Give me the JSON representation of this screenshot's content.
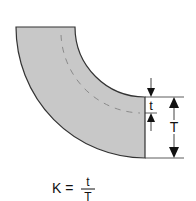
{
  "diagram": {
    "colors": {
      "fill": "#c8c8c8",
      "stroke": "#333333",
      "neutral_axis": "#8a8a8a",
      "arrows": "#111111"
    },
    "labels": {
      "neutral_offset": "t",
      "thickness": "T"
    },
    "formula": {
      "lhs": "K =",
      "numerator": "t",
      "denominator": "T"
    }
  }
}
